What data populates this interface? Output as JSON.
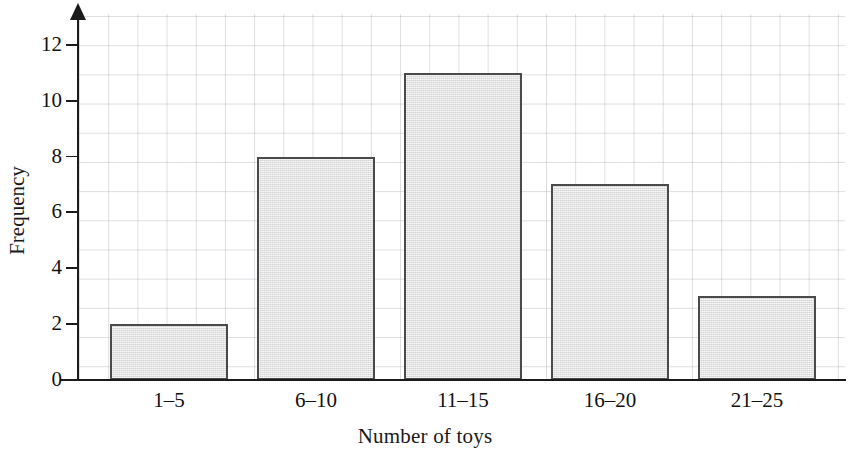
{
  "chart_data": {
    "type": "bar",
    "title": "",
    "xlabel": "Number of toys",
    "ylabel": "Frequency",
    "categories": [
      "1–5",
      "6–10",
      "11–15",
      "16–20",
      "21–25"
    ],
    "values": [
      2,
      8,
      11,
      7,
      3
    ],
    "yticks": [
      0,
      2,
      4,
      6,
      8,
      10,
      12
    ],
    "ytick_labels": [
      "0",
      "2",
      "4",
      "6",
      "8",
      "10",
      "12"
    ],
    "ylim": [
      0,
      13
    ],
    "grid": true,
    "legend": null,
    "bar_fill_color": "#dddddd",
    "bar_edge_color": "#4a4a4a",
    "axis_color": "#1b1b1b",
    "grid_color": "#c9cfd6",
    "background_color": "#ffffff"
  },
  "axes": {
    "y_arrow": "up-arrow-icon",
    "x_axis_name": "x-axis-line",
    "y_axis_name": "y-axis-line"
  },
  "page": {
    "top_cropped_text": "ad"
  }
}
